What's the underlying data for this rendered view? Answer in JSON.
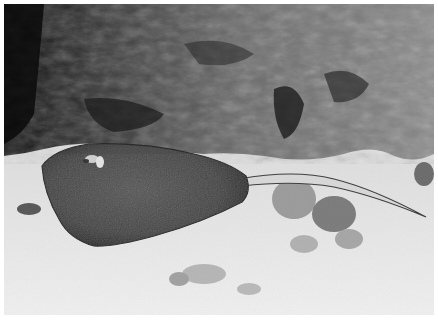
{
  "image": {
    "subject": "stingray resting on sandy seabed beneath rocky reef overhang",
    "tone": "grayscale",
    "colors": {
      "rock_dark": "#141414",
      "rock_mid": "#5a5a5a",
      "rock_light": "#9a9a9a",
      "ray_body": "#4a4a4a",
      "ray_edge": "#2e2e2e",
      "sand": "#e6e6e6",
      "sand_shadow": "#bdbdbd",
      "tail": "#d8d8d8"
    }
  }
}
